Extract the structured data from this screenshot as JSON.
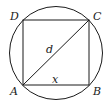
{
  "diagram": {
    "labels": {
      "A": "A",
      "B": "B",
      "C": "C",
      "D": "D",
      "diagonal": "d",
      "side": "x"
    },
    "colors": {
      "stroke": "#1a1a1a",
      "background": "#ffffff"
    }
  }
}
